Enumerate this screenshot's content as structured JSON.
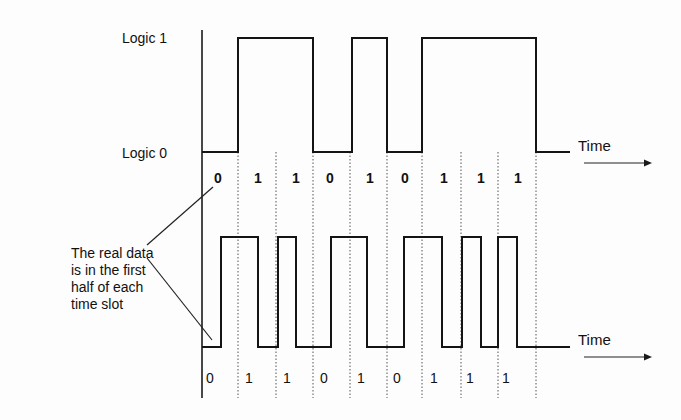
{
  "diagram": {
    "labels": {
      "logic_1": "Logic 1",
      "logic_0": "Logic 0",
      "time_top": "Time",
      "time_bottom": "Time",
      "annotation": [
        "The real data",
        "is in the first",
        "half of each",
        "time slot"
      ]
    },
    "bits": [
      "0",
      "1",
      "1",
      "0",
      "1",
      "0",
      "1",
      "1",
      "1"
    ],
    "slot_boundaries_x": [
      202,
      238,
      276,
      313,
      350,
      387,
      422,
      461,
      498,
      536
    ],
    "top_waveform": {
      "type": "NRZ",
      "high_y": 38,
      "low_y": 152,
      "end_x": 570,
      "pulses": [
        [
          238,
          313
        ],
        [
          352,
          387
        ],
        [
          422,
          536
        ]
      ]
    },
    "bottom_waveform": {
      "type": "RZ",
      "high_y": 237,
      "low_y": 347,
      "end_x": 570,
      "pulses": [
        [
          221,
          258
        ],
        [
          278,
          296
        ],
        [
          331,
          367
        ],
        [
          404,
          442
        ],
        [
          462,
          481
        ],
        [
          498,
          517
        ]
      ]
    },
    "top_bit_label_x": [
      218,
      258,
      296,
      330,
      370,
      405,
      444,
      481,
      518
    ],
    "bottom_bit_label_x": [
      210,
      249,
      287,
      324,
      361,
      397,
      434,
      470,
      506
    ],
    "colors": {
      "line": "#141414",
      "dashed": "#555555",
      "background": "#fdfdfd"
    }
  }
}
